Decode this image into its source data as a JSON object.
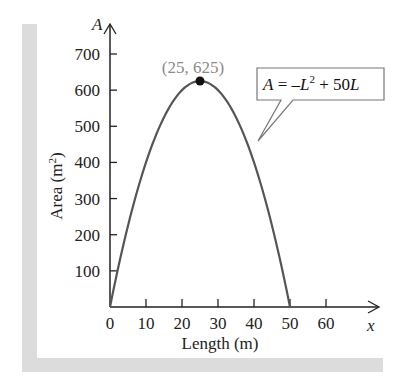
{
  "chart_data": {
    "type": "line",
    "title": "",
    "xlabel": "Length (m)",
    "ylabel": "Area (m²)",
    "x_axis_var": "x",
    "y_axis_var": "A",
    "xlim": [
      0,
      60
    ],
    "ylim": [
      0,
      700
    ],
    "x_ticks": [
      0,
      10,
      20,
      30,
      40,
      50,
      60
    ],
    "y_ticks": [
      100,
      200,
      300,
      400,
      500,
      600,
      700
    ],
    "grid": false,
    "series": [
      {
        "name": "A = -L^2 + 50L",
        "equation": "A = -L² + 50L",
        "x": [
          0,
          5,
          10,
          15,
          20,
          25,
          30,
          35,
          40,
          45,
          50
        ],
        "y": [
          0,
          225,
          400,
          525,
          600,
          625,
          600,
          525,
          400,
          225,
          0
        ]
      }
    ],
    "annotations": [
      {
        "type": "point",
        "label": "(25, 625)",
        "x": 25,
        "y": 625
      },
      {
        "type": "callout",
        "label": "A = −L² + 50L"
      }
    ]
  },
  "labels": {
    "y_var": "A",
    "x_var": "x",
    "y_title": "Area (m",
    "y_title_sup": "2",
    "y_title_end": ")",
    "x_title": "Length (m)",
    "peak": "(25, 625)",
    "eq_A": "A",
    "eq_eq": " = –",
    "eq_L": "L",
    "eq_sup": "2",
    "eq_rest": " + 50",
    "eq_L2": "L",
    "x_ticks": [
      "0",
      "10",
      "20",
      "30",
      "40",
      "50",
      "60"
    ],
    "y_ticks": [
      "100",
      "200",
      "300",
      "400",
      "500",
      "600",
      "700"
    ]
  },
  "colors": {
    "curve": "#555555",
    "axes": "#222222",
    "peak_label": "#8a8a8a",
    "frame": "#dcdcdc"
  }
}
